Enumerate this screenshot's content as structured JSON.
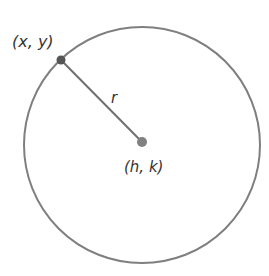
{
  "diagram": {
    "point_label": "(x, y)",
    "center_label": "(h, k)",
    "radius_label": "r",
    "colors": {
      "stroke": "#7a7a7a",
      "point": "#555555",
      "center": "#7a7a7a",
      "text": "#333333"
    }
  }
}
